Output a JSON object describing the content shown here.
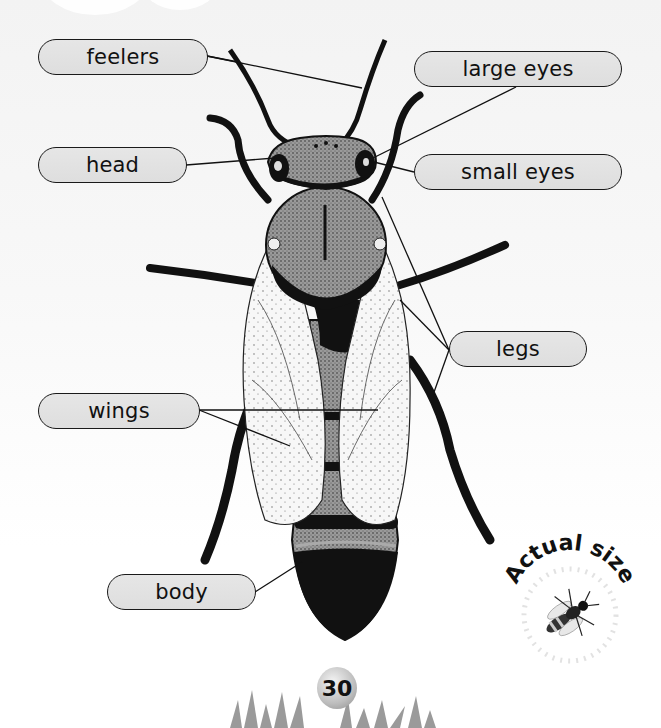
{
  "diagram": {
    "labels": {
      "feelers": "feelers",
      "large_eyes": "large eyes",
      "head": "head",
      "small_eyes": "small eyes",
      "legs": "legs",
      "wings": "wings",
      "body": "body"
    }
  },
  "badge": {
    "text": "Actual size"
  },
  "page": {
    "number": "30"
  },
  "colors": {
    "label_fill": "#e2e2e2",
    "label_border": "#1a1a1a",
    "ink": "#111111",
    "background": "#f6f6f6"
  }
}
